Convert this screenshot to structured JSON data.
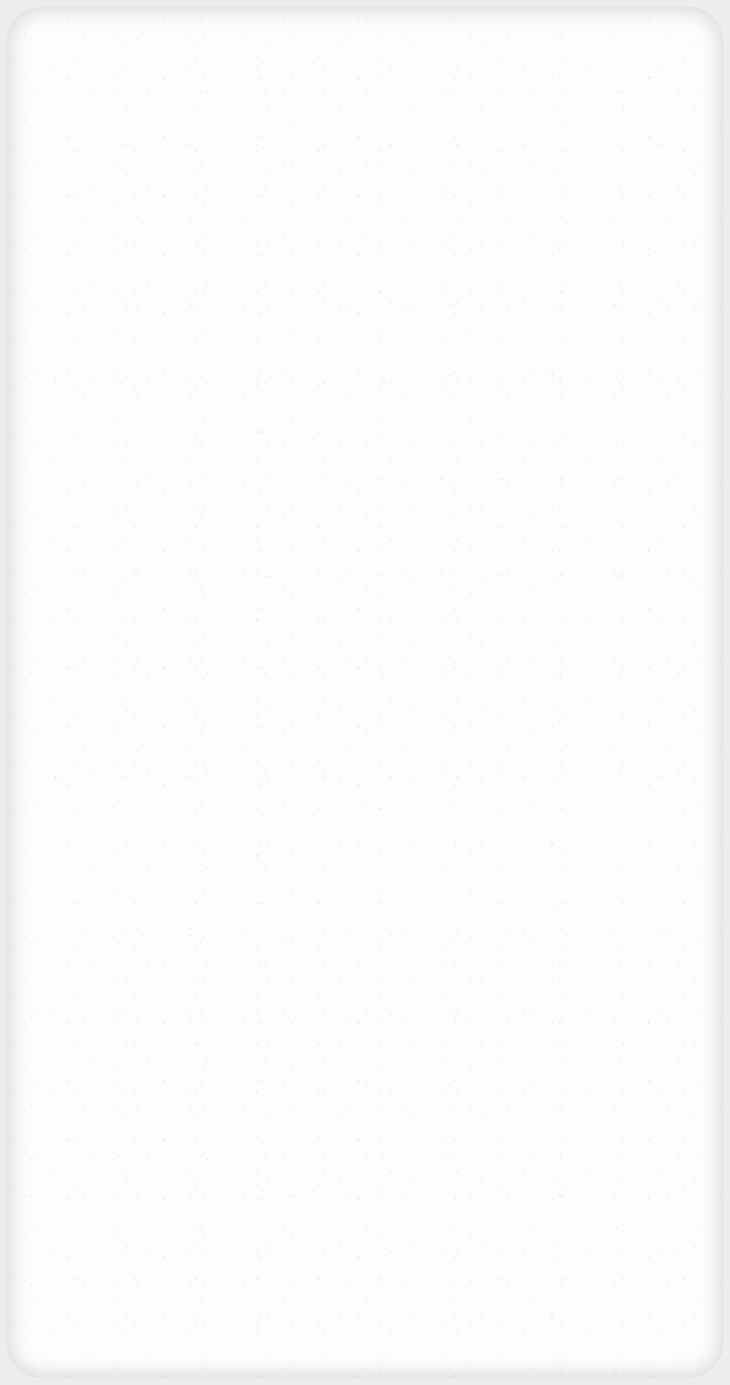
{
  "canvas": {
    "width": 730,
    "height": 1385,
    "content": "blank",
    "visible_text": [],
    "visible_ui_elements": []
  },
  "appearance": {
    "background_color": "#ededed",
    "surface_color": "#fdfdfd",
    "edge_shade_color": "#d2d2d2",
    "corner_radius_px": 36,
    "texture": "light gray speckle noise"
  }
}
